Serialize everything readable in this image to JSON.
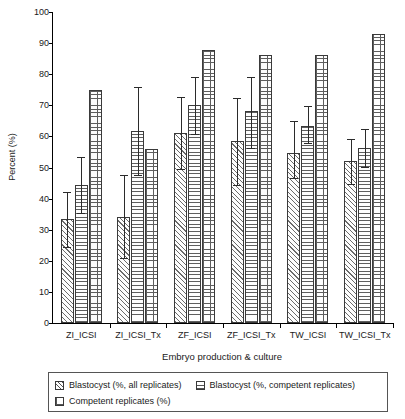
{
  "chart_data": {
    "type": "bar",
    "title": "",
    "xlabel": "Embryo production & culture",
    "ylabel": "Percent (%)",
    "ylim": [
      0,
      100
    ],
    "ytick_step": 10,
    "yticks": [
      0,
      10,
      20,
      30,
      40,
      50,
      60,
      70,
      80,
      90,
      100
    ],
    "ytick_labels": [
      "0",
      "10",
      "20",
      "30",
      "40",
      "50",
      "60",
      "70",
      "80",
      "90",
      "100"
    ],
    "grid": false,
    "legend_position": "below-plot",
    "categories": [
      "ZI_ICSI",
      "ZI_ICSI_Tx",
      "ZF_ICSI",
      "ZF_ICSI_Tx",
      "TW_ICSI",
      "TW_ICSI_Tx"
    ],
    "series": [
      {
        "name": "Blastocyst (%, all replicates)",
        "pattern": "diagonal-hatch",
        "values": [
          33.5,
          34.0,
          61.0,
          58.5,
          54.8,
          52.2
        ],
        "err_low": [
          24.5,
          21.0,
          49.5,
          44.3,
          46.5,
          44.8
        ],
        "err_high": [
          42.0,
          47.5,
          72.8,
          72.2,
          64.8,
          59.3
        ]
      },
      {
        "name": "Blastocyst (%, competent replicates)",
        "pattern": "horizontal-hatch",
        "values": [
          44.5,
          61.8,
          70.0,
          68.2,
          63.3,
          56.4
        ],
        "err_low": [
          35.5,
          47.5,
          60.8,
          56.2,
          57.8,
          50.2
        ],
        "err_high": [
          53.5,
          76.0,
          79.0,
          79.2,
          69.8,
          62.5
        ]
      },
      {
        "name": "Competent replicates (%)",
        "pattern": "cross-hatch",
        "values": [
          75.0,
          56.0,
          87.7,
          86.1,
          86.1,
          93.0
        ],
        "err_low": [
          null,
          null,
          null,
          null,
          null,
          null
        ],
        "err_high": [
          null,
          null,
          null,
          null,
          null,
          null
        ]
      }
    ]
  },
  "legend": {
    "items": [
      {
        "label": "Blastocyst (%, all replicates)",
        "pattern": "diagonal-hatch"
      },
      {
        "label": "Blastocyst (%, competent replicates)",
        "pattern": "horizontal-hatch"
      },
      {
        "label": "Competent replicates (%)",
        "pattern": "cross-hatch"
      }
    ]
  },
  "colors": {
    "axis": "#000000",
    "bar_outline": "#3a3a3a",
    "bar_fill": "#ffffff",
    "hatch": "#5e5e5e",
    "error_bar": "#2b2b2b",
    "text": "#1a1a1a",
    "legend_border": "#555555"
  }
}
